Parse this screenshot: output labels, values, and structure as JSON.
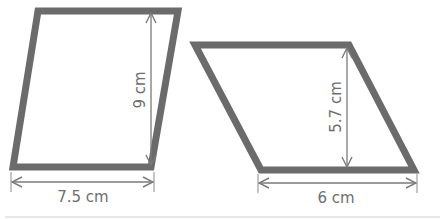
{
  "diagram": {
    "title": "",
    "shapes": [
      {
        "name": "parallelogram-left",
        "base_label": "7.5 cm",
        "height_label": "9 cm",
        "base_value": 7.5,
        "height_value": 9,
        "unit": "cm"
      },
      {
        "name": "parallelogram-right",
        "base_label": "6 cm",
        "height_label": "5.7 cm",
        "base_value": 6,
        "height_value": 5.7,
        "unit": "cm"
      }
    ],
    "colors": {
      "outline": "#6b6b6b",
      "dimension": "#7a7a7a",
      "text": "#6e6e6e",
      "background": "#ffffff"
    }
  }
}
